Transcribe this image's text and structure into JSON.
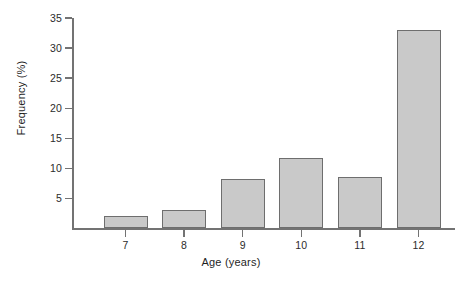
{
  "chart_data": {
    "type": "bar",
    "title": "",
    "xlabel": "Age (years)",
    "ylabel": "Frequency (%)",
    "categories": [
      "7",
      "8",
      "9",
      "10",
      "11",
      "12"
    ],
    "values": [
      2.0,
      3.0,
      8.2,
      11.8,
      8.6,
      33.0
    ],
    "ylim": [
      0,
      35
    ],
    "yticks": [
      5,
      10,
      15,
      20,
      25,
      30,
      35
    ],
    "ytick_labels": [
      "5",
      "10",
      "15",
      "20",
      "25",
      "30",
      "35"
    ],
    "grid": false,
    "legend": null,
    "bar_fill_color": "#c9c9c9",
    "bar_edge_color": "#6e6e6e",
    "axis_color": "#737373",
    "text_color": "#1f1f1f",
    "background_color": "#ffffff"
  }
}
